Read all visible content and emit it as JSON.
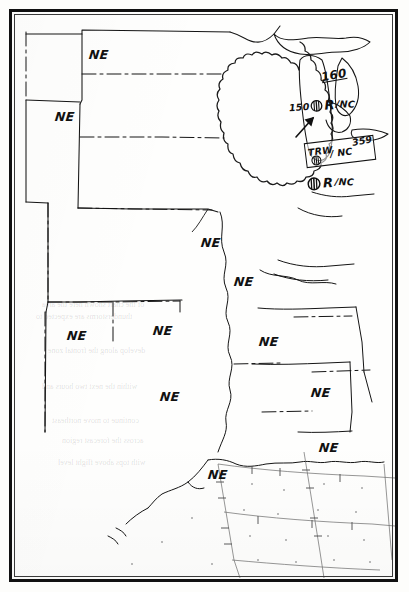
{
  "document": {
    "type": "convective-sigmet-weather-map",
    "region": "Central and Eastern United States",
    "border_color": "#111111",
    "paper_color": "#fdfdfb",
    "ink_color": "#111111"
  },
  "no_echo_labels": [
    {
      "text": "NE",
      "x": 86,
      "y": 44,
      "state": "north-dakota"
    },
    {
      "text": "NE",
      "x": 52,
      "y": 106,
      "state": "south-dakota"
    },
    {
      "text": "NE",
      "x": 198,
      "y": 232,
      "state": "iowa-missouri"
    },
    {
      "text": "NE",
      "x": 231,
      "y": 271,
      "state": "illinois"
    },
    {
      "text": "NE",
      "x": 64,
      "y": 325,
      "state": "new-mexico"
    },
    {
      "text": "NE",
      "x": 150,
      "y": 320,
      "state": "oklahoma"
    },
    {
      "text": "NE",
      "x": 256,
      "y": 331,
      "state": "arkansas-tennessee"
    },
    {
      "text": "NE",
      "x": 157,
      "y": 386,
      "state": "texas"
    },
    {
      "text": "NE",
      "x": 308,
      "y": 382,
      "state": "mississippi-alabama"
    },
    {
      "text": "NE",
      "x": 316,
      "y": 437,
      "state": "alabama-florida"
    },
    {
      "text": "NE",
      "x": 205,
      "y": 464,
      "state": "louisiana-coast"
    }
  ],
  "sigmet_area": {
    "name": "scalloped-convective-sigmet-area",
    "location": "Lake Michigan / Michigan",
    "annotations": [
      {
        "name": "altitude-160",
        "text": "160",
        "underlined": true,
        "x": 318,
        "y": 66
      },
      {
        "name": "altitude-150-echo-R-NC",
        "prefix": "150",
        "symbol": "circled-cross",
        "suffix_r": "R",
        "suffix_nc": "/NC",
        "x": 288,
        "y": 96
      },
      {
        "name": "boxed-trw-nc-359",
        "line_trw": "TRW",
        "symbol": "circled-cross",
        "line_nc": "/ NC",
        "line_num": "359",
        "x": 296,
        "y": 131,
        "width": 68,
        "height": 24
      },
      {
        "name": "lower-echo-R-NC",
        "symbol": "circled-cross",
        "suffix_r": "R",
        "suffix_nc": "/NC",
        "x": 300,
        "y": 173
      }
    ],
    "arrow": {
      "name": "movement-arrow",
      "from_x": 292,
      "from_y": 127,
      "to_x": 308,
      "to_y": 110
    }
  },
  "legend": {
    "ne_meaning": "NE",
    "symbol_meaning": "circled-cross",
    "trw": "TRW",
    "nc": "NC"
  }
}
